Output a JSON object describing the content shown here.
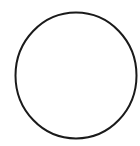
{
  "shape": {
    "type": "circle-outline",
    "stroke_color": "#1a1a1a",
    "fill_color": "#ffffff",
    "background": "#ffffff"
  }
}
